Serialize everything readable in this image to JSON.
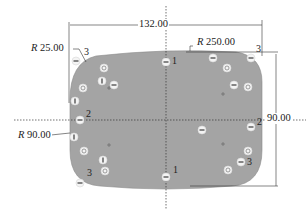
{
  "drawing": {
    "shape_fill": "#a4a4a4",
    "line_color": "#333333",
    "dimensions": {
      "width": {
        "value": "132.00"
      },
      "height": {
        "value": "90.00"
      },
      "corner_radius": {
        "prefix": "R",
        "value": "25.00"
      },
      "top_edge_radius": {
        "prefix": "R",
        "value": "250.00"
      },
      "side_edge_radius": {
        "prefix": "R",
        "value": "90.00"
      }
    },
    "point_labels": [
      {
        "text": "1",
        "pos": "top-center"
      },
      {
        "text": "3",
        "pos": "top-right"
      },
      {
        "text": "3",
        "pos": "top-left"
      },
      {
        "text": "2",
        "pos": "left-mid"
      },
      {
        "text": "2",
        "pos": "right-mid"
      },
      {
        "text": "1",
        "pos": "bottom-center"
      },
      {
        "text": "3",
        "pos": "bottom-left"
      },
      {
        "text": "3",
        "pos": "bottom-right"
      }
    ],
    "constraint_icons": [
      {
        "type": "horizontal",
        "x": 166,
        "y": 62
      },
      {
        "type": "horizontal",
        "x": 213,
        "y": 58
      },
      {
        "type": "horizontal",
        "x": 251,
        "y": 58
      },
      {
        "type": "concentric",
        "x": 227,
        "y": 68
      },
      {
        "type": "horizontal",
        "x": 234,
        "y": 85
      },
      {
        "type": "concentric",
        "x": 248,
        "y": 87
      },
      {
        "type": "horizontal",
        "x": 76,
        "y": 61
      },
      {
        "type": "concentric",
        "x": 104,
        "y": 68
      },
      {
        "type": "vertical",
        "x": 102,
        "y": 81
      },
      {
        "type": "horizontal",
        "x": 114,
        "y": 85
      },
      {
        "type": "concentric",
        "x": 83,
        "y": 88
      },
      {
        "type": "vertical",
        "x": 75,
        "y": 101
      },
      {
        "type": "horizontal",
        "x": 80,
        "y": 120
      },
      {
        "type": "vertical",
        "x": 74,
        "y": 137
      },
      {
        "type": "concentric",
        "x": 84,
        "y": 151
      },
      {
        "type": "vertical",
        "x": 103,
        "y": 160
      },
      {
        "type": "concentric",
        "x": 105,
        "y": 171
      },
      {
        "type": "horizontal",
        "x": 80,
        "y": 183
      },
      {
        "type": "horizontal",
        "x": 166,
        "y": 177
      },
      {
        "type": "horizontal",
        "x": 202,
        "y": 130
      },
      {
        "type": "horizontal",
        "x": 251,
        "y": 127
      },
      {
        "type": "concentric",
        "x": 248,
        "y": 151
      },
      {
        "type": "horizontal",
        "x": 241,
        "y": 162
      },
      {
        "type": "concentric",
        "x": 228,
        "y": 170
      }
    ]
  }
}
